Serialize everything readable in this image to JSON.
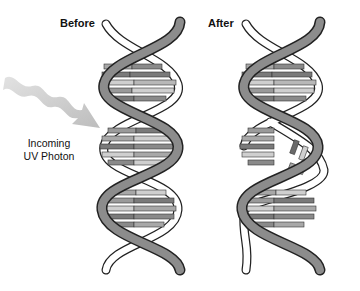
{
  "diagram": {
    "panels": [
      {
        "title": "Before",
        "state": "intact double helix"
      },
      {
        "title": "After",
        "state": "helix with kinked/broken base pairs"
      }
    ],
    "arrow_label": {
      "line1": "Incoming",
      "line2": "UV Photon"
    },
    "colors": {
      "strand_front": "#8c8c8c",
      "strand_back": "#ffffff",
      "outline": "#222222",
      "base_dark": "#7a7a7a",
      "base_mid": "#a8a8a8",
      "base_light": "#cfcfcf",
      "arrow": "#c8c8c8"
    }
  }
}
